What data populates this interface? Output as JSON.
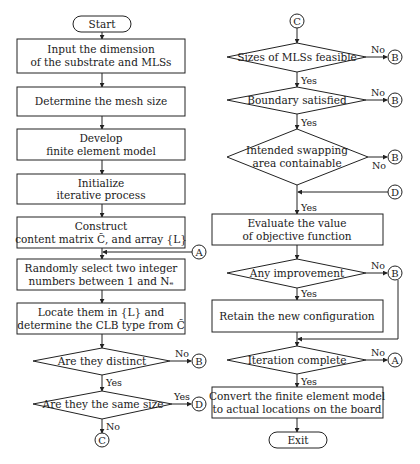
{
  "flowchart": {
    "start": "Start",
    "exit": "Exit",
    "left_column": {
      "steps": [
        {
          "line1": "Input the dimension",
          "line2": "of the substrate and MLSs"
        },
        {
          "line1": "Determine the mesh size",
          "line2": ""
        },
        {
          "line1": "Develop",
          "line2": "finite element model"
        },
        {
          "line1": "Initialize",
          "line2": "iterative process"
        },
        {
          "line1": "Construct",
          "line2": "content matrix C̃, and array {L}"
        },
        {
          "line1": "Randomly select two integer",
          "line2": "numbers between 1 and Nₑ"
        },
        {
          "line1": "Locate them in {L} and",
          "line2": "determine the CLB type from C̃"
        }
      ],
      "decisions": [
        {
          "text": "Are they distinct",
          "no_label": "No",
          "yes_label": "Yes",
          "no_target": "B"
        },
        {
          "text": "Are they the same size",
          "yes_label": "Yes",
          "no_label": "No",
          "yes_target": "D",
          "no_target": "C"
        }
      ],
      "connector_in": "A",
      "connector_out": "C"
    },
    "right_column": {
      "connector_in": "C",
      "decisions": [
        {
          "text": "Sizes of MLSs feasible",
          "no_label": "No",
          "yes_label": "Yes",
          "no_target": "B"
        },
        {
          "text": "Boundary satisfied",
          "no_label": "No",
          "yes_label": "Yes",
          "no_target": "B"
        },
        {
          "line1": "Intended swapping",
          "line2": "area containable",
          "no_label": "No",
          "yes_label": "Yes",
          "no_target": "B"
        },
        {
          "text": "Any improvement",
          "no_label": "No",
          "yes_label": "Yes",
          "no_target": "B"
        },
        {
          "text": "Iteration complete",
          "no_label": "No",
          "yes_label": "Yes",
          "no_target": "A"
        }
      ],
      "join_connector": "D",
      "steps": [
        {
          "line1": "Evaluate the value",
          "line2": "of objective function"
        },
        {
          "line1": "Retain the new configuration",
          "line2": ""
        },
        {
          "line1": "Convert the finite element model",
          "line2": "to actual locations on the board"
        }
      ]
    }
  }
}
